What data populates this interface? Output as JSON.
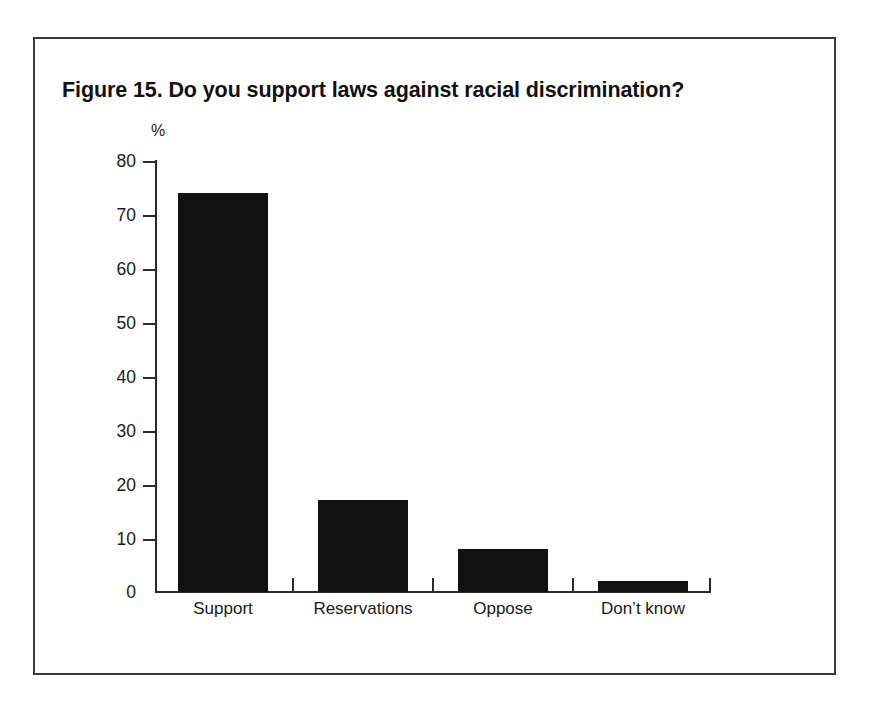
{
  "figure": {
    "title": "Figure 15. Do you support laws against racial discrimination?",
    "frame_color": "#3a3a3a",
    "background_color": "#ffffff"
  },
  "chart_data": {
    "type": "bar",
    "title": "Figure 15. Do you support laws against racial discrimination?",
    "categories": [
      "Support",
      "Reservations",
      "Oppose",
      "Don’t know"
    ],
    "values": [
      74,
      17,
      8,
      2
    ],
    "series": [
      {
        "name": "Percentage of respondents",
        "values": [
          74,
          17,
          8,
          2
        ]
      }
    ],
    "xlabel": "",
    "ylabel": "%",
    "ylim": [
      0,
      80
    ],
    "ytick_labels": [
      "80",
      "70",
      "60",
      "50",
      "40",
      "30",
      "20",
      "10",
      "0"
    ],
    "ytick_values": [
      80,
      70,
      60,
      50,
      40,
      30,
      20,
      10,
      0
    ],
    "ytick_step": 10,
    "grid": false,
    "legend": false,
    "bar_color": "#111111",
    "axis_color": "#2b2b2b"
  }
}
